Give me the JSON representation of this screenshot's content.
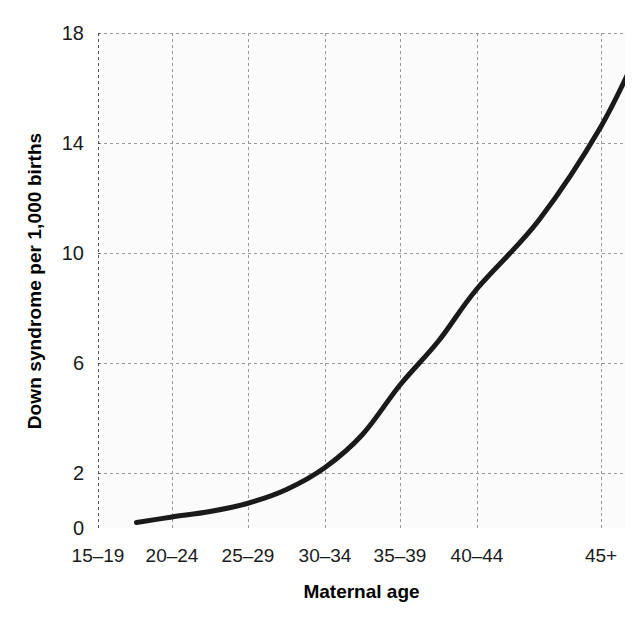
{
  "chart_data": {
    "type": "line",
    "title": "",
    "xlabel": "Maternal age",
    "ylabel": "Down syndrome per 1,000 births",
    "categories": [
      "15–19",
      "20–24",
      "25–29",
      "30–34",
      "35–39",
      "40–44",
      "45+"
    ],
    "ytick_labels": [
      "0",
      "2",
      "6",
      "10",
      "14",
      "18"
    ],
    "ytick_values": [
      0,
      2,
      6,
      10,
      14,
      18
    ],
    "ylim": [
      0,
      18
    ],
    "xlim": [
      0,
      6
    ],
    "grid": true,
    "grid_style": "dashed",
    "legend": "none",
    "series": [
      {
        "name": "Down syndrome rate",
        "x": [
          0.52,
          1.0,
          1.5,
          2.0,
          2.5,
          3.0,
          3.5,
          4.0,
          4.5,
          5.0,
          5.5,
          6.0,
          6.35
        ],
        "values": [
          0.2,
          0.4,
          0.6,
          0.9,
          1.4,
          2.2,
          3.4,
          5.2,
          6.8,
          8.7,
          11.2,
          14.6,
          17.8
        ],
        "color": "#1a1a1a",
        "linewidth": 5
      }
    ],
    "colors": {
      "line": "#1a1a1a",
      "grid": "#999999",
      "axis": "#555555",
      "text": "#1a1a1a",
      "plot_background": "#fbfbfb",
      "figure_background": "#ffffff"
    }
  }
}
